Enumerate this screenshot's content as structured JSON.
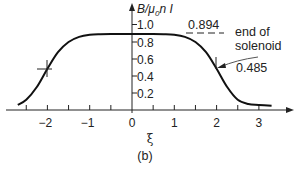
{
  "chart_data": {
    "type": "line",
    "title": "",
    "caption": "(b)",
    "xlabel": "ξ",
    "ylabel": "B/μ₀nI",
    "ylabel_parts": {
      "b": "B/",
      "mu": "μ",
      "sub": "0",
      "rest": "n I"
    },
    "xlim": [
      -2.8,
      3.4
    ],
    "ylim": [
      0,
      1.05
    ],
    "grid": false,
    "legend": "none",
    "x_ticks": [
      -2.5,
      -2,
      -1.5,
      -1,
      -0.5,
      0,
      0.5,
      1,
      1.5,
      2,
      2.5,
      3
    ],
    "x_tick_labels": [
      "−2",
      "−1",
      "0",
      "1",
      "2",
      "3"
    ],
    "x_tick_label_values": [
      -2,
      -1,
      0,
      1,
      2,
      3
    ],
    "y_ticks": [
      0.2,
      0.4,
      0.6,
      0.8,
      1.0
    ],
    "y_tick_labels": [
      "0.2",
      "0.4",
      "0.6",
      "0.8",
      "1.0"
    ],
    "series": [
      {
        "name": "B/μ₀nI",
        "x": [
          -2.7,
          -2.5,
          -2.25,
          -2.0,
          -1.75,
          -1.5,
          -1.25,
          -1.0,
          -0.75,
          -0.5,
          0,
          0.5,
          0.75,
          1.0,
          1.25,
          1.5,
          1.75,
          2.0,
          2.25,
          2.5,
          2.75,
          3.0,
          3.3
        ],
        "values": [
          0.06,
          0.12,
          0.27,
          0.485,
          0.68,
          0.8,
          0.86,
          0.885,
          0.892,
          0.894,
          0.894,
          0.894,
          0.892,
          0.885,
          0.86,
          0.8,
          0.68,
          0.485,
          0.27,
          0.12,
          0.07,
          0.06,
          0.05
        ]
      }
    ],
    "annotations": [
      {
        "text": "0.894",
        "x": 1.6,
        "y": 0.894,
        "note": "dashed line at plateau value"
      },
      {
        "text": "end of",
        "x": 2.6,
        "y": 0.9
      },
      {
        "text": "solenoid",
        "x": 2.6,
        "y": 0.77
      },
      {
        "text": "0.485",
        "x": 2.6,
        "y": 0.5,
        "note": "arrow points to curve at ξ=2"
      }
    ],
    "markers": [
      {
        "x": -2,
        "y": 0.485,
        "type": "cross"
      },
      {
        "x": 2,
        "y": 0.485,
        "type": "vertical-tick"
      }
    ]
  }
}
